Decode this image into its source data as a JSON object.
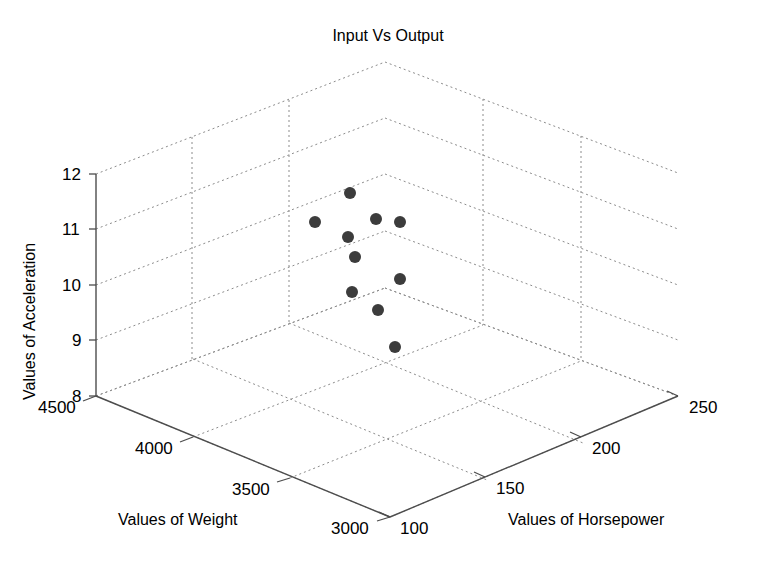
{
  "chart_data": {
    "type": "scatter",
    "dimensions": "3d",
    "title": "Input Vs Output",
    "xlabel": "Values of Weight",
    "ylabel": "Values of Horsepower",
    "zlabel": "Values of Acceleration",
    "xticks": [
      "4500",
      "4000",
      "3500",
      "3000"
    ],
    "xtick_values": [
      4500,
      4000,
      3500,
      3000
    ],
    "yticks": [
      "100",
      "150",
      "200",
      "250"
    ],
    "ytick_values": [
      100,
      150,
      200,
      250
    ],
    "zticks": [
      "8",
      "9",
      "10",
      "11",
      "12"
    ],
    "ztick_values": [
      8,
      9,
      10,
      11,
      12
    ],
    "xlim": [
      3000,
      4500
    ],
    "ylim": [
      100,
      250
    ],
    "zlim": [
      8,
      12
    ],
    "grid": true,
    "legend": "none",
    "marker": {
      "shape": "circle",
      "color": "#3c3c3c",
      "size_px": 12,
      "filled": true
    },
    "points": [
      {
        "weight": 4320,
        "horsepower": 143,
        "acceleration": 11.1,
        "px": 315,
        "py": 222
      },
      {
        "weight": 3990,
        "horsepower": 127,
        "acceleration": 11.7,
        "px": 350,
        "py": 193
      },
      {
        "weight": 3960,
        "horsepower": 126,
        "acceleration": 10.9,
        "px": 348,
        "py": 237
      },
      {
        "weight": 3760,
        "horsepower": 138,
        "acceleration": 11.2,
        "px": 376,
        "py": 219
      },
      {
        "weight": 3610,
        "horsepower": 165,
        "acceleration": 11.1,
        "px": 400,
        "py": 222
      },
      {
        "weight": 3900,
        "horsepower": 133,
        "acceleration": 10.5,
        "px": 355,
        "py": 257
      },
      {
        "weight": 3880,
        "horsepower": 135,
        "acceleration": 9.85,
        "px": 352,
        "py": 292
      },
      {
        "weight": 3600,
        "horsepower": 170,
        "acceleration": 10.1,
        "px": 400,
        "py": 279
      },
      {
        "weight": 3700,
        "horsepower": 152,
        "acceleration": 9.5,
        "px": 378,
        "py": 310
      },
      {
        "weight": 3620,
        "horsepower": 168,
        "acceleration": 8.8,
        "px": 395,
        "py": 347
      }
    ],
    "series": [
      {
        "name": "data",
        "x": [
          4320,
          3990,
          3960,
          3760,
          3610,
          3900,
          3880,
          3600,
          3700,
          3620
        ],
        "y": [
          143,
          127,
          126,
          138,
          165,
          133,
          135,
          170,
          152,
          168
        ],
        "z": [
          11.1,
          11.7,
          10.9,
          11.2,
          11.1,
          10.5,
          9.85,
          10.1,
          9.5,
          8.8
        ]
      }
    ]
  },
  "axes_geometry": {
    "comment": "screen-space anchor points of the 3D box in pixels",
    "origin_front_bottom": [
      390,
      517
    ],
    "left_bottom": [
      96,
      396
    ],
    "right_bottom": [
      678,
      396
    ],
    "back_bottom": [
      385,
      288
    ],
    "left_top": [
      96,
      174
    ],
    "right_top": [
      678,
      173
    ],
    "back_top": [
      385,
      62
    ],
    "front_top": [
      390,
      288
    ]
  },
  "style": {
    "grid_color": "#8c8c8c",
    "axis_color": "#4d4d4d",
    "marker_color": "#3c3c3c",
    "background": "#ffffff",
    "text_color": "#000000"
  },
  "labels": {
    "title": "Input Vs Output",
    "x_axis": "Values of Weight",
    "y_axis": "Values of Horsepower",
    "z_axis": "Values of Acceleration",
    "xt0": "4500",
    "xt1": "4000",
    "xt2": "3500",
    "xt3": "3000",
    "yt0": "100",
    "yt1": "150",
    "yt2": "200",
    "yt3": "250",
    "zt0": "12",
    "zt1": "11",
    "zt2": "10",
    "zt3": "9",
    "zt4": "8"
  }
}
